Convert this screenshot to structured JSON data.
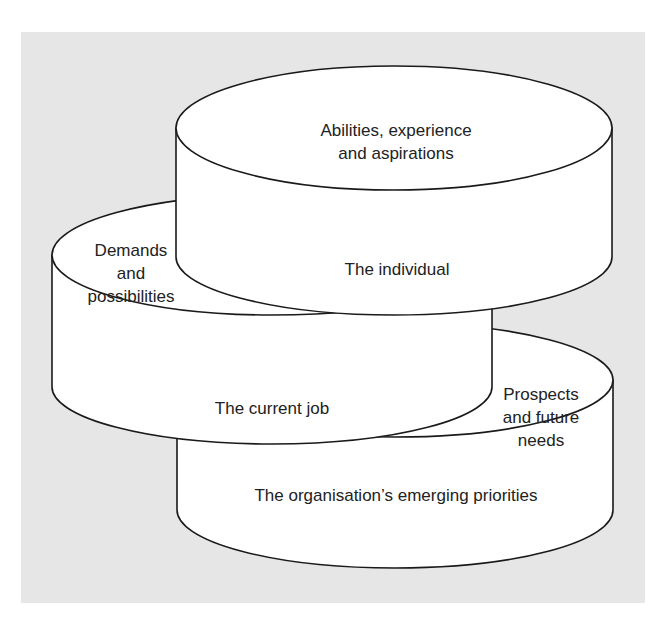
{
  "colors": {
    "panel": "#e6e6e6",
    "fill": "#ffffff",
    "stroke": "#1a1a1a",
    "text": "#222222"
  },
  "cylinders": {
    "individual": {
      "top_label": [
        "Abilities, experience",
        "and aspirations"
      ],
      "side_label": "The individual"
    },
    "current_job": {
      "top_label": [
        "Demands",
        "and",
        "possibilities"
      ],
      "side_label": "The current job"
    },
    "organisation": {
      "top_label": [
        "Prospects",
        "and future",
        "needs"
      ],
      "side_label": "The organisation’s emerging priorities"
    }
  }
}
